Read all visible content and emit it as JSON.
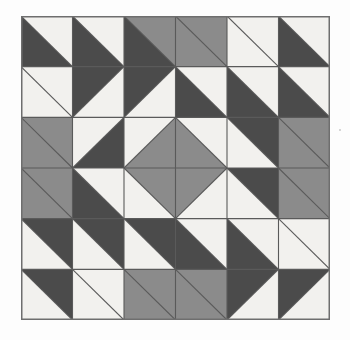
{
  "figure": {
    "kind": "quilt-pattern",
    "rows": 6,
    "cols": 6,
    "background_color": "#fdfdfd",
    "border_color": "#6e6e6e",
    "grid_line_color": "#5a5a5a"
  },
  "palette": {
    "white": "#f2f1ee",
    "gray": "#8b8b8b",
    "dark": "#4b4b4b"
  },
  "legend": [
    {
      "key": "white",
      "label": "Light",
      "color": "#f2f1ee"
    },
    {
      "key": "gray",
      "label": "Medium",
      "color": "#8b8b8b"
    },
    {
      "key": "dark",
      "label": "Dark",
      "color": "#4b4b4b"
    }
  ],
  "geometry": {
    "origin_x": 21,
    "origin_y": 16,
    "width": 309,
    "height": 304,
    "cell_width": 51.5,
    "cell_height": 50.6667
  },
  "chart_data": {
    "type": "heatmap",
    "xlabel": "",
    "ylabel": "",
    "categories": [
      "c1",
      "c2",
      "c3",
      "c4",
      "c5",
      "c6"
    ],
    "rows": [
      "r1",
      "r2",
      "r3",
      "r4",
      "r5",
      "r6"
    ],
    "note": "Each cell is a square split by a diagonal into two triangles. 'split' = 'main' means the divider runs top-left to bottom-right (triangles: upper-right / lower-left); 'anti' means the divider runs top-right to bottom-left (triangles: upper-left / lower-right).",
    "cells": [
      [
        {
          "split": "main",
          "a": "white",
          "b": "dark"
        },
        {
          "split": "main",
          "a": "white",
          "b": "dark"
        },
        {
          "split": "main",
          "a": "gray",
          "b": "dark"
        },
        {
          "split": "main",
          "a": "gray",
          "b": "gray"
        },
        {
          "split": "main",
          "a": "white",
          "b": "white"
        },
        {
          "split": "main",
          "a": "white",
          "b": "dark"
        }
      ],
      [
        {
          "split": "main",
          "a": "white",
          "b": "white"
        },
        {
          "split": "anti",
          "a": "dark",
          "b": "white"
        },
        {
          "split": "anti",
          "a": "dark",
          "b": "white"
        },
        {
          "split": "main",
          "a": "white",
          "b": "dark"
        },
        {
          "split": "main",
          "a": "white",
          "b": "dark"
        },
        {
          "split": "main",
          "a": "white",
          "b": "dark"
        }
      ],
      [
        {
          "split": "main",
          "a": "gray",
          "b": "gray"
        },
        {
          "split": "anti",
          "a": "white",
          "b": "dark"
        },
        {
          "split": "anti",
          "a": "white",
          "b": "gray"
        },
        {
          "split": "main",
          "a": "white",
          "b": "gray"
        },
        {
          "split": "main",
          "a": "dark",
          "b": "white"
        },
        {
          "split": "main",
          "a": "gray",
          "b": "gray"
        }
      ],
      [
        {
          "split": "main",
          "a": "gray",
          "b": "gray"
        },
        {
          "split": "main",
          "a": "white",
          "b": "dark"
        },
        {
          "split": "main",
          "a": "gray",
          "b": "white"
        },
        {
          "split": "anti",
          "a": "gray",
          "b": "white"
        },
        {
          "split": "main",
          "a": "dark",
          "b": "white"
        },
        {
          "split": "main",
          "a": "gray",
          "b": "gray"
        }
      ],
      [
        {
          "split": "main",
          "a": "dark",
          "b": "white"
        },
        {
          "split": "main",
          "a": "dark",
          "b": "white"
        },
        {
          "split": "main",
          "a": "dark",
          "b": "white"
        },
        {
          "split": "main",
          "a": "white",
          "b": "dark"
        },
        {
          "split": "main",
          "a": "white",
          "b": "dark"
        },
        {
          "split": "main",
          "a": "white",
          "b": "white"
        }
      ],
      [
        {
          "split": "main",
          "a": "dark",
          "b": "white"
        },
        {
          "split": "main",
          "a": "white",
          "b": "white"
        },
        {
          "split": "main",
          "a": "gray",
          "b": "gray"
        },
        {
          "split": "main",
          "a": "gray",
          "b": "gray"
        },
        {
          "split": "anti",
          "a": "dark",
          "b": "white"
        },
        {
          "split": "anti",
          "a": "dark",
          "b": "white"
        }
      ]
    ]
  }
}
